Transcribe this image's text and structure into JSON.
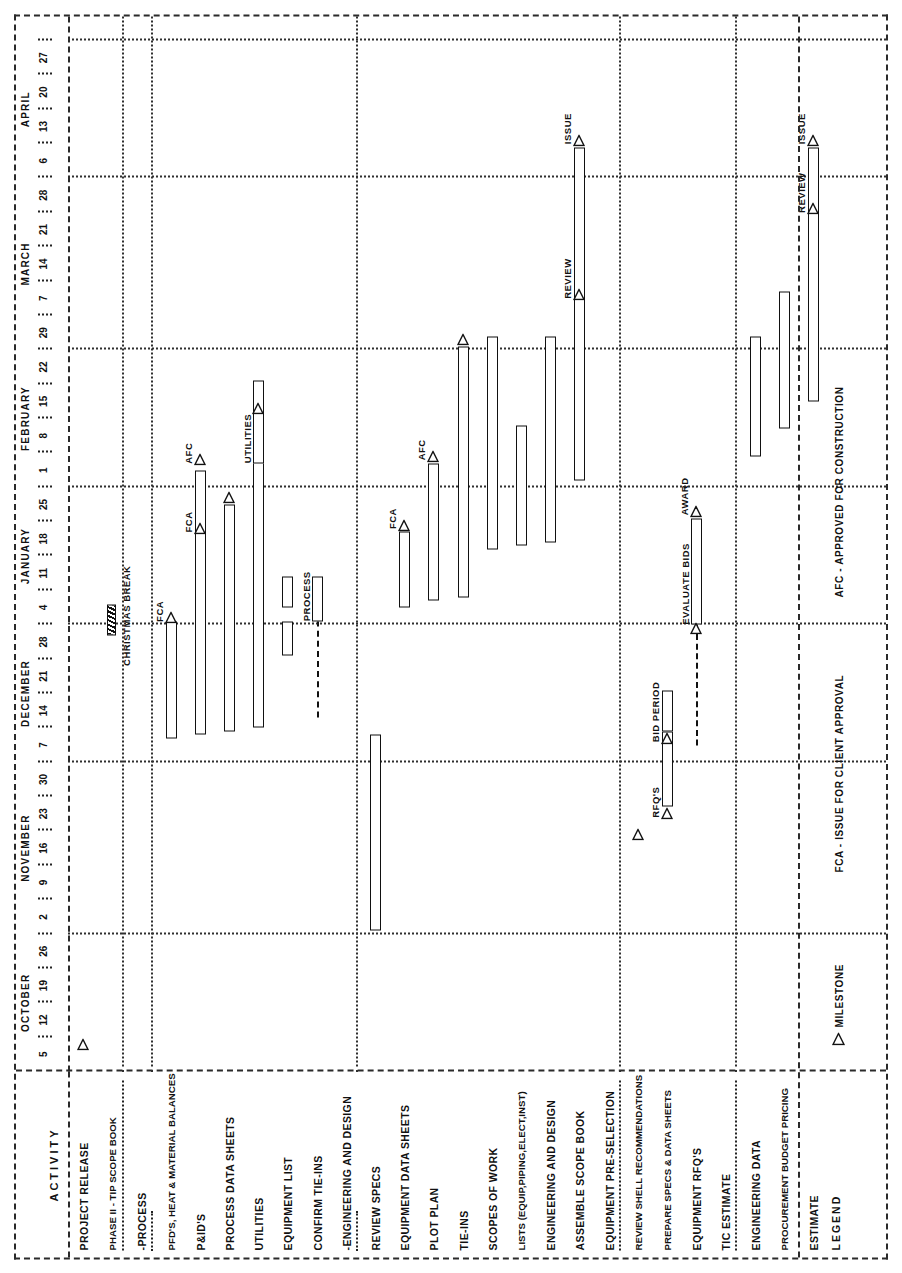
{
  "document": {
    "type": "gantt-schedule",
    "orientation": "rotated-90-ccw",
    "activity_column_header": "ACTIVITY"
  },
  "timeline": {
    "months": [
      {
        "name": "OCTOBER",
        "days": [
          "5",
          "12",
          "19",
          "26"
        ]
      },
      {
        "name": "NOVEMBER",
        "days": [
          "2",
          "9",
          "16",
          "23",
          "30"
        ]
      },
      {
        "name": "DECEMBER",
        "days": [
          "7",
          "14",
          "21",
          "28"
        ]
      },
      {
        "name": "JANUARY",
        "days": [
          "4",
          "11",
          "18",
          "25"
        ]
      },
      {
        "name": "FEBRUARY",
        "days": [
          "1",
          "8",
          "15",
          "22"
        ]
      },
      {
        "name": "MARCH",
        "days": [
          "29",
          "7",
          "14",
          "21",
          "28"
        ]
      },
      {
        "name": "APRIL",
        "days": [
          "6",
          "13",
          "20",
          "27"
        ]
      }
    ],
    "all_days": [
      "5",
      "12",
      "19",
      "26",
      "2",
      "9",
      "16",
      "23",
      "30",
      "7",
      "14",
      "21",
      "28",
      "4",
      "11",
      "18",
      "25",
      "1",
      "8",
      "15",
      "22",
      "29",
      "7",
      "14",
      "21",
      "28",
      "6",
      "13",
      "20",
      "27"
    ]
  },
  "rows": [
    {
      "label": "PROJECT RELEASE",
      "kind": "activity"
    },
    {
      "label": "PHASE II - TIP SCOPE BOOK",
      "kind": "header"
    },
    {
      "label": "-PROCESS",
      "kind": "subheader"
    },
    {
      "label": "PFD'S, HEAT & MATERIAL BALANCES",
      "kind": "activity"
    },
    {
      "label": "P&ID'S",
      "kind": "activity"
    },
    {
      "label": "PROCESS DATA SHEETS",
      "kind": "activity"
    },
    {
      "label": "UTILITIES",
      "kind": "activity"
    },
    {
      "label": "EQUIPMENT LIST",
      "kind": "activity"
    },
    {
      "label": "CONFIRM TIE-INS",
      "kind": "activity"
    },
    {
      "label": "-ENGINEERING AND DESIGN",
      "kind": "subheader"
    },
    {
      "label": "REVIEW SPECS",
      "kind": "activity"
    },
    {
      "label": "EQUIPMENT DATA SHEETS",
      "kind": "activity"
    },
    {
      "label": "PLOT PLAN",
      "kind": "activity"
    },
    {
      "label": "TIE-INS",
      "kind": "activity"
    },
    {
      "label": "SCOPES OF WORK",
      "kind": "activity"
    },
    {
      "label": "LISTS (EQUIP,PIPING,ELECT,INST)",
      "kind": "activity"
    },
    {
      "label": "ENGINEERING AND DESIGN",
      "kind": "activity"
    },
    {
      "label": "ASSEMBLE SCOPE BOOK",
      "kind": "activity"
    },
    {
      "label": "EQUIPMENT PRE-SELECTION",
      "kind": "header"
    },
    {
      "label": "REVIEW SHELL RECOMMENDATIONS",
      "kind": "activity"
    },
    {
      "label": "PREPARE SPECS & DATA SHEETS",
      "kind": "activity"
    },
    {
      "label": "EQUIPMENT RFQ'S",
      "kind": "activity"
    },
    {
      "label": "TIC ESTIMATE",
      "kind": "header"
    },
    {
      "label": "ENGINEERING DATA",
      "kind": "activity"
    },
    {
      "label": "PROCUREMENT BUDGET PRICING",
      "kind": "activity"
    },
    {
      "label": "ESTIMATE",
      "kind": "activity"
    }
  ],
  "legend": {
    "title": "LEGEND",
    "items": [
      {
        "symbol": "milestone-triangle",
        "label": "MILESTONE"
      },
      {
        "symbol": "text",
        "label": "FCA - ISSUE FOR CLIENT APPROVAL"
      },
      {
        "symbol": "text",
        "label": "AFC - APPROVED FOR CONSTRUCTION"
      }
    ]
  },
  "annotations": {
    "christmas_break": "CHRISTMAS BREAK",
    "bar_labels": [
      "FCA",
      "AFC",
      "UTILITIES",
      "PROCESS",
      "EVALUATE BIDS",
      "AWARD",
      "RFQ'S",
      "BID PERIOD",
      "REVIEW",
      "ISSUE"
    ]
  },
  "chart_data": {
    "type": "bar",
    "xlabel": "",
    "ylabel": "ACTIVITY",
    "grid": true,
    "categories": [
      "PROJECT RELEASE",
      "PFD'S, HEAT & MATERIAL BALANCES",
      "P&ID'S",
      "PROCESS DATA SHEETS",
      "UTILITIES",
      "EQUIPMENT LIST",
      "CONFIRM TIE-INS",
      "REVIEW SPECS",
      "EQUIPMENT DATA SHEETS",
      "PLOT PLAN",
      "TIE-INS",
      "SCOPES OF WORK",
      "LISTS (EQUIP,PIPING,ELECT,INST)",
      "ENGINEERING AND DESIGN",
      "ASSEMBLE SCOPE BOOK",
      "REVIEW SHELL RECOMMENDATIONS",
      "PREPARE SPECS & DATA SHEETS",
      "EQUIPMENT RFQ'S",
      "ENGINEERING DATA",
      "PROCUREMENT BUDGET PRICING",
      "ESTIMATE"
    ],
    "tasks": [
      {
        "row": 0,
        "name": "PROJECT RELEASE",
        "milestones": [
          {
            "at": 0.3
          }
        ],
        "bars": []
      },
      {
        "row": 3,
        "name": "PFD'S, HEAT & MATERIAL BALANCES",
        "bars": [
          {
            "start": 9.2,
            "end": 12.6
          }
        ],
        "milestones": [
          {
            "at": 12.7,
            "label": "FCA"
          }
        ]
      },
      {
        "row": 4,
        "name": "P&ID'S",
        "bars": [
          {
            "start": 9.3,
            "end": 17.0
          }
        ],
        "milestones": [
          {
            "at": 15.3,
            "label": "FCA"
          },
          {
            "at": 17.3,
            "label": "AFC"
          }
        ]
      },
      {
        "row": 5,
        "name": "PROCESS DATA SHEETS",
        "bars": [
          {
            "start": 9.4,
            "end": 16.0
          }
        ],
        "milestones": [
          {
            "at": 16.2
          }
        ]
      },
      {
        "row": 6,
        "name": "UTILITIES",
        "bars": [
          {
            "start": 9.5,
            "end": 18.6
          },
          {
            "start": 17.2,
            "end": 19.6,
            "label": "UTILITIES"
          }
        ],
        "milestones": [
          {
            "at": 18.8
          }
        ]
      },
      {
        "row": 7,
        "name": "EQUIPMENT LIST",
        "bars": [
          {
            "start": 11.6,
            "end": 12.6,
            "style": "box"
          },
          {
            "start": 13.0,
            "end": 13.9,
            "style": "box"
          }
        ],
        "milestones": []
      },
      {
        "row": 8,
        "name": "CONFIRM TIE-INS",
        "bars": [
          {
            "start": 9.8,
            "end": 12.9,
            "style": "dashed"
          },
          {
            "start": 12.6,
            "end": 13.9,
            "label": "PROCESS"
          }
        ],
        "milestones": []
      },
      {
        "row": 10,
        "name": "REVIEW SPECS",
        "bars": [
          {
            "start": 3.6,
            "end": 9.3
          }
        ],
        "milestones": []
      },
      {
        "row": 11,
        "name": "EQUIPMENT DATA SHEETS",
        "bars": [
          {
            "start": 13.0,
            "end": 15.2
          }
        ],
        "milestones": [
          {
            "at": 15.4,
            "label": "FCA"
          }
        ]
      },
      {
        "row": 12,
        "name": "PLOT PLAN",
        "bars": [
          {
            "start": 13.2,
            "end": 17.2
          }
        ],
        "milestones": [
          {
            "at": 17.4,
            "label": "AFC"
          }
        ]
      },
      {
        "row": 13,
        "name": "TIE-INS",
        "bars": [
          {
            "start": 13.3,
            "end": 20.6
          }
        ],
        "milestones": [
          {
            "at": 20.8
          }
        ]
      },
      {
        "row": 14,
        "name": "SCOPES OF WORK",
        "bars": [
          {
            "start": 14.7,
            "end": 20.9
          }
        ],
        "milestones": []
      },
      {
        "row": 15,
        "name": "LISTS (EQUIP,PIPING,ELECT,INST)",
        "bars": [
          {
            "start": 14.8,
            "end": 18.3
          }
        ],
        "milestones": []
      },
      {
        "row": 16,
        "name": "ENGINEERING AND DESIGN",
        "bars": [
          {
            "start": 14.9,
            "end": 20.9
          }
        ],
        "milestones": []
      },
      {
        "row": 17,
        "name": "ASSEMBLE SCOPE BOOK",
        "bars": [
          {
            "start": 16.7,
            "end": 26.4
          }
        ],
        "milestones": [
          {
            "at": 22.1,
            "label": "REVIEW"
          },
          {
            "at": 26.6,
            "label": "ISSUE"
          }
        ]
      },
      {
        "row": 19,
        "name": "REVIEW SHELL RECOMMENDATIONS",
        "bars": [],
        "milestones": [
          {
            "at": 6.4
          }
        ]
      },
      {
        "row": 20,
        "name": "PREPARE SPECS & DATA SHEETS",
        "bars": [
          {
            "start": 7.2,
            "end": 9.4
          },
          {
            "start": 9.4,
            "end": 10.6,
            "style": "box"
          }
        ],
        "milestones": [
          {
            "at": 7.0,
            "label": "RFQ'S"
          },
          {
            "at": 9.2,
            "label": "BID PERIOD"
          }
        ]
      },
      {
        "row": 21,
        "name": "EQUIPMENT RFQ'S",
        "bars": [
          {
            "start": 9.0,
            "end": 12.5,
            "style": "dashed"
          },
          {
            "start": 12.5,
            "end": 15.6,
            "label": "EVALUATE BIDS"
          }
        ],
        "milestones": [
          {
            "at": 12.4
          },
          {
            "at": 15.8,
            "label": "AWARD"
          }
        ]
      },
      {
        "row": 23,
        "name": "ENGINEERING DATA",
        "bars": [
          {
            "start": 17.4,
            "end": 20.9
          }
        ],
        "milestones": []
      },
      {
        "row": 24,
        "name": "PROCUREMENT BUDGET PRICING",
        "bars": [
          {
            "start": 18.2,
            "end": 22.2
          }
        ],
        "milestones": []
      },
      {
        "row": 25,
        "name": "ESTIMATE",
        "bars": [
          {
            "start": 19.0,
            "end": 26.4
          }
        ],
        "milestones": [
          {
            "at": 24.6,
            "label": "REVIEW"
          },
          {
            "at": 26.6,
            "label": "ISSUE"
          }
        ]
      }
    ],
    "legend_entries": [
      "MILESTONE",
      "FCA - ISSUE FOR CLIENT APPROVAL",
      "AFC - APPROVED FOR CONSTRUCTION"
    ]
  }
}
